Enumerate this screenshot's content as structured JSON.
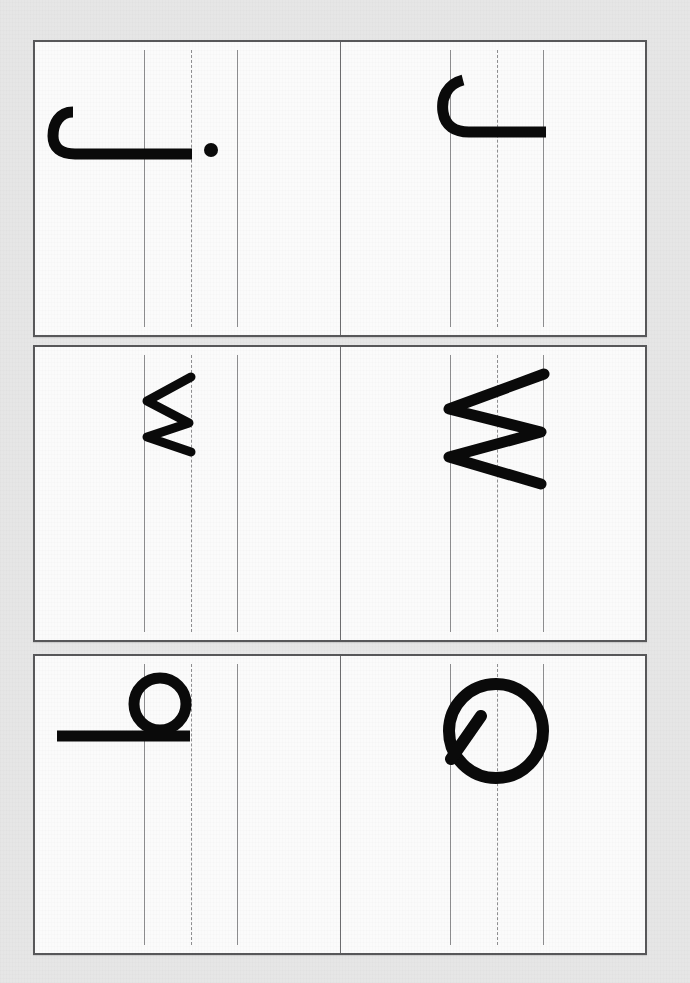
{
  "worksheet": {
    "type": "handwriting-tracing-worksheet",
    "orientation": "rotated-90-counterclockwise",
    "background_color": "#e6e6e6",
    "paper_color": "#fbfbfb",
    "border_color": "#58585a",
    "guideline_color": "#8e8e90",
    "ink_color": "#0a0a0a",
    "rows": [
      {
        "index": 1,
        "cells": [
          {
            "letter": "j",
            "case": "lowercase",
            "name": "letter-j-lowercase"
          },
          {
            "letter": "J",
            "case": "uppercase",
            "name": "letter-j-uppercase"
          }
        ]
      },
      {
        "index": 2,
        "cells": [
          {
            "letter": "w",
            "case": "lowercase",
            "name": "letter-w-lowercase"
          },
          {
            "letter": "W",
            "case": "uppercase",
            "name": "letter-w-uppercase"
          }
        ]
      },
      {
        "index": 3,
        "cells": [
          {
            "letter": "q",
            "case": "lowercase",
            "name": "letter-q-lowercase"
          },
          {
            "letter": "Q",
            "case": "uppercase",
            "name": "letter-q-uppercase"
          }
        ]
      }
    ],
    "guidelines": {
      "top_label": "top line",
      "mid_label": "dashed midline",
      "base_label": "baseline"
    }
  }
}
